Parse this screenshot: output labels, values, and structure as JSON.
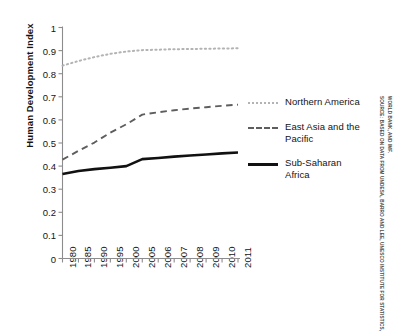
{
  "chart_data": {
    "type": "line",
    "title": "",
    "xlabel": "",
    "ylabel": "Human Development Index",
    "ylim": [
      0,
      1
    ],
    "ytick_step": 0.1,
    "grid": false,
    "legend_position": "right",
    "categories": [
      "1980",
      "1985",
      "1990",
      "1995",
      "2000",
      "2005",
      "2006",
      "2007",
      "2008",
      "2009",
      "2010",
      "2011"
    ],
    "yticks": [
      "0",
      "0.1",
      "0.2",
      "0.3",
      "0.4",
      "0.5",
      "0.6",
      "0.7",
      "0.8",
      "0.9",
      "1"
    ],
    "series": [
      {
        "name": "Northern America",
        "style": "dotted",
        "color": "#b3b3b3",
        "values": [
          0.835,
          0.855,
          0.872,
          0.886,
          0.896,
          0.902,
          0.904,
          0.906,
          0.907,
          0.908,
          0.909,
          0.91
        ]
      },
      {
        "name": "East Asia and the Pacific",
        "style": "dashed",
        "color": "#5e5e5e",
        "values": [
          0.428,
          0.466,
          0.502,
          0.545,
          0.581,
          0.623,
          0.633,
          0.642,
          0.649,
          0.655,
          0.661,
          0.666
        ]
      },
      {
        "name": "Sub-Saharan Africa",
        "style": "solid",
        "color": "#111111",
        "values": [
          0.366,
          0.379,
          0.387,
          0.393,
          0.4,
          0.43,
          0.435,
          0.441,
          0.446,
          0.45,
          0.455,
          0.459
        ]
      }
    ]
  },
  "legend": {
    "entries": [
      {
        "label": "Northern America",
        "swatch": "dotted-line-swatch"
      },
      {
        "label": "East Asia and the Pacific",
        "swatch": "dashed-line-swatch"
      },
      {
        "label": "Sub-Saharan Africa",
        "swatch": "solid-line-swatch"
      }
    ]
  },
  "source_note": {
    "line1": "SOURCE: BASED ON DATA FROM UNDESA, BARRO AND LEE, UNESCO INSTITUTE FOR STATISTICS,",
    "line2": "WORLD BANK, AND IMF."
  }
}
